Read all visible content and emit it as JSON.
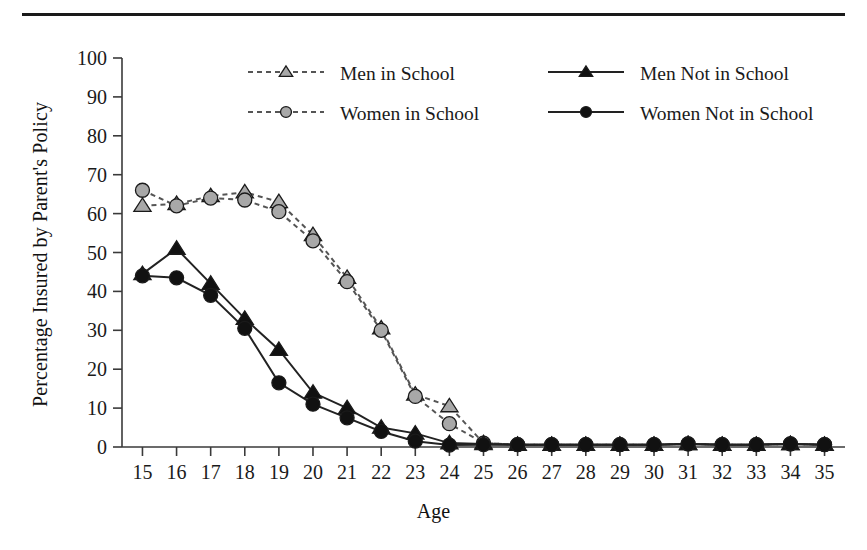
{
  "chart_data": {
    "type": "line",
    "title": "",
    "xlabel": "Age",
    "ylabel": "Percentage Insured by Parent's Policy",
    "xlim": [
      14.4,
      35.6
    ],
    "ylim": [
      0,
      100
    ],
    "yticks": [
      0,
      10,
      20,
      30,
      40,
      50,
      60,
      70,
      80,
      90,
      100
    ],
    "xticks": [
      15,
      16,
      17,
      18,
      19,
      20,
      21,
      22,
      23,
      24,
      25,
      26,
      27,
      28,
      29,
      30,
      31,
      32,
      33,
      34,
      35
    ],
    "categories": [
      15,
      16,
      17,
      18,
      19,
      20,
      21,
      22,
      23,
      24,
      25,
      26,
      27,
      28,
      29,
      30,
      31,
      32,
      33,
      34,
      35
    ],
    "grid": false,
    "legend_position": "top-center",
    "series": [
      {
        "name": "Men in School",
        "marker": "triangle",
        "marker_fill": "#a8a8a8",
        "line_style": "dashed",
        "line_color": "#555555",
        "values": [
          62,
          62.5,
          64.5,
          65.5,
          63,
          54.5,
          43.5,
          30.5,
          13.5,
          10.5,
          1,
          0.6,
          0.6,
          0.6,
          0.6,
          0.6,
          0.8,
          0.6,
          0.6,
          0.8,
          0.6
        ]
      },
      {
        "name": "Women in School",
        "marker": "circle",
        "marker_fill": "#a8a8a8",
        "line_style": "dashed",
        "line_color": "#555555",
        "values": [
          66,
          62,
          64,
          63.5,
          60.5,
          53,
          42.5,
          30,
          13,
          6,
          1,
          0.6,
          0.6,
          0.6,
          0.6,
          0.6,
          0.8,
          0.6,
          0.6,
          0.8,
          0.6
        ]
      },
      {
        "name": "Men Not in School",
        "marker": "triangle",
        "marker_fill": "#111111",
        "line_style": "solid",
        "line_color": "#222222",
        "values": [
          44.5,
          51,
          42,
          33,
          25,
          14,
          10,
          5,
          3.5,
          1,
          0.8,
          0.6,
          0.6,
          0.6,
          0.6,
          0.6,
          0.8,
          0.6,
          0.6,
          0.8,
          0.6
        ]
      },
      {
        "name": "Women Not in School",
        "marker": "circle",
        "marker_fill": "#111111",
        "line_style": "solid",
        "line_color": "#222222",
        "values": [
          44,
          43.5,
          39,
          30.5,
          16.5,
          11,
          7.5,
          4,
          1.5,
          0.5,
          0.6,
          0.6,
          0.6,
          0.6,
          0.6,
          0.6,
          0.8,
          0.6,
          0.6,
          0.8,
          0.6
        ]
      }
    ]
  },
  "axes": {
    "ylabel": "Percentage Insured by Parent's Policy",
    "xlabel": "Age",
    "ytick_labels": [
      "100",
      "90",
      "80",
      "70",
      "60",
      "50",
      "40",
      "30",
      "20",
      "10",
      "0"
    ],
    "xtick_labels": [
      "15",
      "16",
      "17",
      "18",
      "19",
      "20",
      "21",
      "22",
      "23",
      "24",
      "25",
      "26",
      "27",
      "28",
      "29",
      "30",
      "31",
      "32",
      "33",
      "34",
      "35"
    ]
  },
  "legend": {
    "entries": [
      {
        "label": "Men in School"
      },
      {
        "label": "Women in School"
      },
      {
        "label": "Men Not in School"
      },
      {
        "label": "Women Not in School"
      }
    ]
  },
  "colors": {
    "light_marker": "#a8a8a8",
    "dark_marker": "#111111",
    "dashed_line": "#555555",
    "solid_line": "#222222",
    "axis": "#3a3a3a",
    "rule": "#1a1a1a"
  }
}
